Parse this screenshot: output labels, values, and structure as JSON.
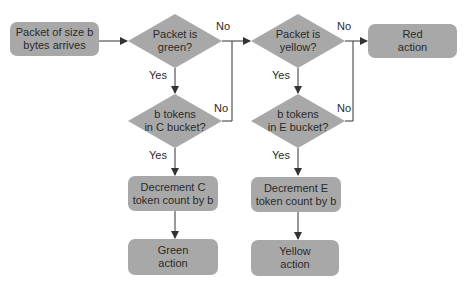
{
  "colors": {
    "node_fill": "#a8a8a8",
    "line": "#333333",
    "text": "#2a2a2a"
  },
  "nodes": {
    "start": {
      "line1": "Packet of size b",
      "line2": "bytes arrives"
    },
    "green_check": {
      "line1": "Packet is",
      "line2": "green?"
    },
    "c_bucket_check": {
      "line1": "b tokens",
      "line2": "in C bucket?"
    },
    "decrement_c": {
      "line1": "Decrement C",
      "line2": "token count by b"
    },
    "green_action": {
      "line1": "Green",
      "line2": "action"
    },
    "yellow_check": {
      "line1": "Packet is",
      "line2": "yellow?"
    },
    "e_bucket_check": {
      "line1": "b tokens",
      "line2": "in E bucket?"
    },
    "decrement_e": {
      "line1": "Decrement E",
      "line2": "token count by b"
    },
    "yellow_action": {
      "line1": "Yellow",
      "line2": "action"
    },
    "red_action": {
      "line1": "Red",
      "line2": "action"
    }
  },
  "edge_labels": {
    "green_no": "No",
    "green_yes": "Yes",
    "c_bucket_no": "No",
    "c_bucket_yes": "Yes",
    "yellow_no": "No",
    "yellow_yes": "Yes",
    "e_bucket_no": "No",
    "e_bucket_yes": "Yes"
  }
}
